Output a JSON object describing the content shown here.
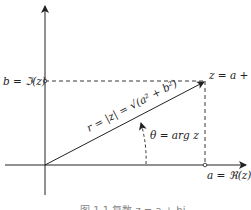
{
  "diagram": {
    "type": "complex-plane",
    "labels": {
      "imag_part": "b = ℑ(z)",
      "real_part": "a = ℜ(z)",
      "point": "z = a + bi",
      "modulus": "r = |z| = √(a² + b²)",
      "argument": "θ = arg z"
    },
    "caption": "图 1.1  复数 z = a + bi",
    "colors": {
      "stroke": "#222222",
      "background": "#ffffff"
    }
  }
}
